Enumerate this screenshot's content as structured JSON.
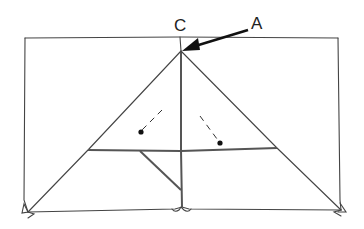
{
  "diagram": {
    "type": "origami-fold-diagram",
    "labels": {
      "apex": "C",
      "arrow_target": "A"
    },
    "colors": {
      "line": "#444444",
      "background": "#ffffff",
      "label": "#222222"
    }
  }
}
